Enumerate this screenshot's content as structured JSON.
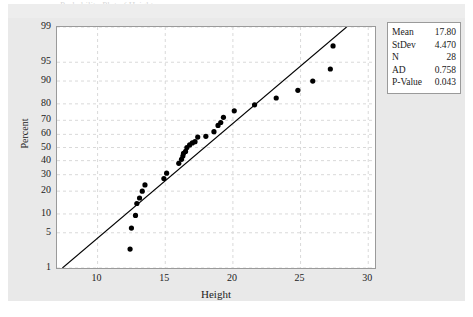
{
  "figure": {
    "background_color": "#e9e9e9",
    "plot_background_color": "#ffffff",
    "frame_color": "#9a9a9a",
    "gridline_color": "#d9d9d9",
    "marker_color": "#000000",
    "fit_line_color": "#000000",
    "top_remnant_text": "Probability Plot of Height"
  },
  "stats": {
    "rows": [
      {
        "key": "Mean",
        "value": "17.80"
      },
      {
        "key": "StDev",
        "value": "4.470"
      },
      {
        "key": "N",
        "value": "28"
      },
      {
        "key": "AD",
        "value": "0.758"
      },
      {
        "key": "P-Value",
        "value": "0.043"
      }
    ]
  },
  "chart_data": {
    "type": "scatter",
    "title": "",
    "subtitle": "",
    "xlabel": "Height",
    "ylabel": "Percent",
    "xlim": [
      7.0,
      30.5
    ],
    "ylim": [
      1,
      99
    ],
    "yscale": "normal-probability",
    "grid": true,
    "legend_position": "outside-right-top",
    "x_ticks": [
      10,
      15,
      20,
      25,
      30
    ],
    "x_tick_labels": [
      "10",
      "15",
      "20",
      "25",
      "30"
    ],
    "y_ticks": [
      1,
      5,
      10,
      20,
      30,
      40,
      50,
      60,
      70,
      80,
      90,
      95,
      99
    ],
    "y_tick_labels": [
      "1",
      "5",
      "10",
      "20",
      "30",
      "40",
      "50",
      "60",
      "70",
      "80",
      "90",
      "95",
      "99"
    ],
    "series": [
      {
        "name": "Height",
        "marker": "filled-circle",
        "x": [
          12.4,
          12.5,
          12.8,
          12.9,
          13.1,
          13.3,
          13.5,
          14.9,
          15.1,
          16.0,
          16.2,
          16.3,
          16.35,
          16.5,
          16.6,
          16.8,
          17.0,
          17.2,
          17.4,
          18.0,
          18.6,
          18.9,
          19.1,
          19.3,
          20.1,
          21.6,
          23.2,
          24.8,
          25.9,
          27.2,
          27.4
        ],
        "y": [
          2.5,
          6.0,
          9.5,
          14.0,
          16.5,
          20.0,
          23.5,
          27.5,
          31.0,
          38.0,
          41.0,
          43.5,
          45.5,
          47.0,
          50.0,
          52.0,
          53.5,
          54.5,
          58.0,
          58.5,
          62.0,
          66.5,
          68.5,
          72.0,
          76.0,
          79.5,
          83.0,
          86.5,
          90.0,
          93.5,
          97.5
        ]
      },
      {
        "name": "Normal fit line",
        "type": "line",
        "x": [
          7.4,
          28.4
        ],
        "y": [
          1.0,
          99.0
        ]
      }
    ],
    "annotations": [
      "Mean 17.80",
      "StDev 4.470",
      "N 28",
      "AD 0.758",
      "P-Value 0.043"
    ]
  }
}
